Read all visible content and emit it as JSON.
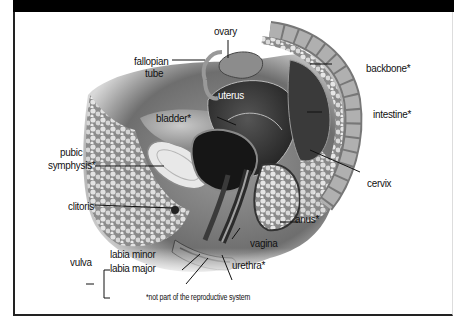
{
  "figure": {
    "title": "",
    "labels": {
      "ovary": "ovary",
      "fallopian_tube_line1": "fallopian",
      "fallopian_tube_line2": "tube",
      "uterus": "uterus",
      "bladder": "bladder*",
      "pubic_symphysis_line1": "pubic",
      "pubic_symphysis_line2": "symphysis*",
      "clitoris": "clitoris",
      "vulva": "vulva",
      "labia_minor": "labia minor",
      "labia_major": "labia major",
      "backbone": "backbone*",
      "intestine": "intestine*",
      "cervix": "cervix",
      "anus": "anus*",
      "vagina": "vagina",
      "urethra": "urethra*"
    },
    "footnote": "*not part of the reproductive system"
  },
  "colors": {
    "header_band": "#000000",
    "background": "#ffffff",
    "border": "#222222"
  }
}
